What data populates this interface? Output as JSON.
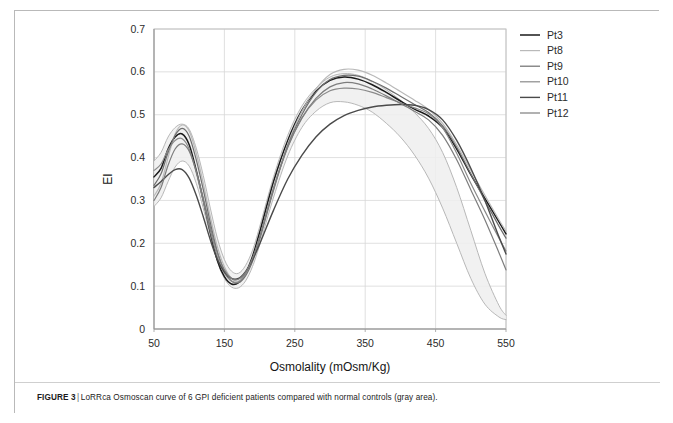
{
  "caption": {
    "label": "FIGURE 3",
    "separator": "|",
    "text": "LoRRca Osmoscan curve of 6 GPI deficient patients compared with normal controls (gray area)."
  },
  "chart_data": {
    "type": "line",
    "title": "",
    "xlabel": "Osmolality (mOsm/Kg)",
    "ylabel": "EI",
    "xlim": [
      50,
      550
    ],
    "ylim": [
      0,
      0.7
    ],
    "xticks": [
      "50",
      "150",
      "250",
      "350",
      "450",
      "550"
    ],
    "xtick_values": [
      50,
      150,
      250,
      350,
      450,
      550
    ],
    "yticks": [
      "0",
      "0.1",
      "0.2",
      "0.3",
      "0.4",
      "0.5",
      "0.6",
      "0.7"
    ],
    "ytick_values": [
      0,
      0.1,
      0.2,
      0.3,
      0.4,
      0.5,
      0.6,
      0.7
    ],
    "grid": true,
    "legend_position": "right",
    "legend": [
      "Pt3",
      "Pt8",
      "Pt9",
      "Pt10",
      "Pt11",
      "Pt12"
    ],
    "x": [
      50,
      60,
      70,
      80,
      90,
      100,
      110,
      120,
      130,
      140,
      150,
      160,
      170,
      180,
      190,
      200,
      220,
      240,
      260,
      280,
      300,
      320,
      340,
      360,
      380,
      400,
      420,
      440,
      460,
      480,
      500,
      520,
      540,
      550
    ],
    "series": [
      {
        "name": "Pt3",
        "color": "#1a1a1a",
        "width": 1.5,
        "values": [
          0.355,
          0.375,
          0.42,
          0.448,
          0.455,
          0.43,
          0.37,
          0.3,
          0.225,
          0.16,
          0.122,
          0.105,
          0.108,
          0.13,
          0.17,
          0.225,
          0.345,
          0.44,
          0.51,
          0.555,
          0.58,
          0.588,
          0.583,
          0.57,
          0.552,
          0.532,
          0.513,
          0.497,
          0.47,
          0.42,
          0.36,
          0.305,
          0.25,
          0.222
        ]
      },
      {
        "name": "Pt8",
        "color": "#b9b9b9",
        "width": 1.2,
        "values": [
          0.31,
          0.34,
          0.4,
          0.455,
          0.476,
          0.462,
          0.41,
          0.34,
          0.262,
          0.192,
          0.145,
          0.118,
          0.112,
          0.128,
          0.162,
          0.212,
          0.33,
          0.432,
          0.508,
          0.56,
          0.594,
          0.606,
          0.604,
          0.592,
          0.574,
          0.554,
          0.534,
          0.512,
          0.48,
          0.43,
          0.37,
          0.312,
          0.255,
          0.228
        ]
      },
      {
        "name": "Pt9",
        "color": "#6e6e6e",
        "width": 1.2,
        "values": [
          0.335,
          0.362,
          0.412,
          0.452,
          0.468,
          0.45,
          0.395,
          0.325,
          0.248,
          0.18,
          0.135,
          0.112,
          0.108,
          0.124,
          0.158,
          0.208,
          0.325,
          0.428,
          0.5,
          0.552,
          0.582,
          0.592,
          0.59,
          0.578,
          0.562,
          0.543,
          0.524,
          0.505,
          0.474,
          0.424,
          0.362,
          0.3,
          0.24,
          0.212
        ]
      },
      {
        "name": "Pt10",
        "color": "#8a8a8a",
        "width": 1.2,
        "values": [
          0.37,
          0.385,
          0.418,
          0.44,
          0.444,
          0.42,
          0.365,
          0.298,
          0.228,
          0.168,
          0.13,
          0.112,
          0.11,
          0.128,
          0.164,
          0.214,
          0.33,
          0.425,
          0.492,
          0.534,
          0.556,
          0.562,
          0.56,
          0.552,
          0.54,
          0.528,
          0.516,
          0.502,
          0.47,
          0.41,
          0.34,
          0.275,
          0.212,
          0.182
        ]
      },
      {
        "name": "Pt11",
        "color": "#4a4a4a",
        "width": 1.4,
        "values": [
          0.33,
          0.344,
          0.36,
          0.372,
          0.372,
          0.352,
          0.312,
          0.262,
          0.208,
          0.162,
          0.133,
          0.118,
          0.118,
          0.134,
          0.162,
          0.198,
          0.278,
          0.35,
          0.405,
          0.448,
          0.478,
          0.498,
          0.51,
          0.518,
          0.522,
          0.524,
          0.522,
          0.512,
          0.488,
          0.44,
          0.375,
          0.3,
          0.215,
          0.175
        ]
      },
      {
        "name": "Pt12",
        "color": "#7d7d7d",
        "width": 1.2,
        "values": [
          0.3,
          0.33,
          0.382,
          0.42,
          0.432,
          0.415,
          0.368,
          0.305,
          0.238,
          0.178,
          0.138,
          0.118,
          0.116,
          0.132,
          0.166,
          0.214,
          0.328,
          0.424,
          0.492,
          0.538,
          0.565,
          0.575,
          0.572,
          0.56,
          0.544,
          0.526,
          0.508,
          0.488,
          0.452,
          0.395,
          0.325,
          0.255,
          0.178,
          0.138
        ]
      }
    ],
    "reference_band": {
      "name": "normal controls (gray area)",
      "fill": "#efefef",
      "stroke": "#b0b0b0",
      "upper": [
        0.392,
        0.412,
        0.448,
        0.47,
        0.478,
        0.466,
        0.422,
        0.358,
        0.282,
        0.212,
        0.162,
        0.135,
        0.13,
        0.148,
        0.184,
        0.238,
        0.356,
        0.452,
        0.52,
        0.562,
        0.588,
        0.596,
        0.592,
        0.578,
        0.558,
        0.534,
        0.505,
        0.468,
        0.412,
        0.33,
        0.23,
        0.13,
        0.055,
        0.032
      ],
      "lower": [
        0.286,
        0.306,
        0.344,
        0.378,
        0.392,
        0.38,
        0.34,
        0.282,
        0.218,
        0.158,
        0.118,
        0.098,
        0.096,
        0.112,
        0.146,
        0.196,
        0.308,
        0.404,
        0.47,
        0.508,
        0.528,
        0.53,
        0.522,
        0.506,
        0.48,
        0.448,
        0.406,
        0.352,
        0.282,
        0.2,
        0.118,
        0.058,
        0.028,
        0.022
      ]
    }
  }
}
